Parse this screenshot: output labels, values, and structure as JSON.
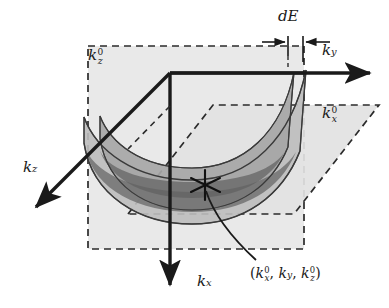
{
  "figure": {
    "domain": "scientific-diagram",
    "background_color": "#ffffff",
    "ink_color": "#1a1a1a"
  },
  "axes": [
    {
      "id": "ky",
      "label_k": "k",
      "label_sub": "y",
      "direction": "right",
      "name": "k-y-axis"
    },
    {
      "id": "kx",
      "label_k": "k",
      "label_sub": "x",
      "direction": "down",
      "name": "k-x-axis"
    },
    {
      "id": "kz",
      "label_k": "k",
      "label_sub": "z",
      "direction": "down-left",
      "name": "k-z-axis"
    }
  ],
  "annotations": {
    "thickness": {
      "label": "dE",
      "name": "energy-shell-thickness-label"
    },
    "plane_kz": {
      "label_k": "k",
      "label_sub": "z",
      "label_sup": "0",
      "name": "constant-kz-plane-label"
    },
    "plane_kx": {
      "label_k": "k",
      "label_sub": "x",
      "label_sup": "0",
      "name": "constant-kx-plane-label"
    },
    "point": {
      "open_paren": "(",
      "k1": "k",
      "k1_sub": "x",
      "k1_sup": "0",
      "sep1": ", ",
      "k2": "k",
      "k2_sub": "y",
      "sep2": ", ",
      "k3": "k",
      "k3_sub": "z",
      "k3_sup": "0",
      "close_paren": ")",
      "name": "intersection-point-coordinates"
    }
  },
  "shapes": {
    "vertical_dashed_plane": {
      "name": "constant-kz-dashed-rectangle",
      "style": "dashed",
      "fill": "#e8e8e8"
    },
    "tilted_dashed_plane": {
      "name": "constant-kx-dashed-parallelogram",
      "style": "dashed",
      "fill": "#e2e2e2"
    },
    "energy_shell_outer": {
      "name": "outer-paraboloid-surface",
      "fill": "#b4b4b4"
    },
    "energy_shell_inner": {
      "name": "inner-paraboloid-surface",
      "fill": "#9a9a9a"
    },
    "shell_band_dark": {
      "name": "shell-plane-intersection-band",
      "fill": "#7e7e7e"
    },
    "marker": {
      "name": "intersection-star-marker",
      "glyph": "asterisk"
    },
    "leader": {
      "name": "callout-leader-line"
    }
  }
}
